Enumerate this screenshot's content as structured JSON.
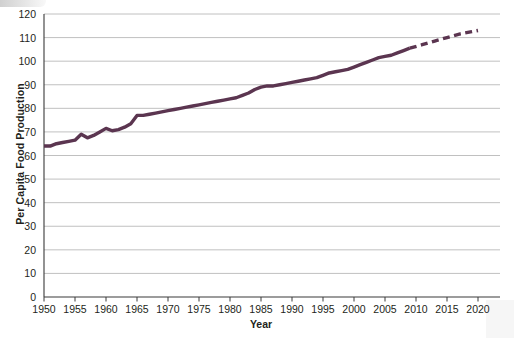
{
  "chart_data": {
    "type": "line",
    "title": "",
    "xlabel": "Year",
    "ylabel": "Per Capita Food Production",
    "xlim": [
      1950,
      2020
    ],
    "ylim": [
      0,
      120
    ],
    "xticks": [
      1950,
      1955,
      1960,
      1965,
      1970,
      1975,
      1980,
      1985,
      1990,
      1995,
      2000,
      2005,
      2010,
      2015,
      2020
    ],
    "yticks": [
      0,
      10,
      20,
      30,
      40,
      50,
      60,
      70,
      80,
      90,
      100,
      110,
      120
    ],
    "grid": "horizontal",
    "legend": "none",
    "line_color": "#5b3550",
    "series": [
      {
        "name": "Per Capita Food Production (observed)",
        "style": "solid",
        "x": [
          1950,
          1951,
          1952,
          1953,
          1954,
          1955,
          1956,
          1957,
          1958,
          1959,
          1960,
          1961,
          1962,
          1963,
          1964,
          1965,
          1966,
          1967,
          1968,
          1969,
          1970,
          1971,
          1972,
          1973,
          1974,
          1975,
          1976,
          1977,
          1978,
          1979,
          1980,
          1981,
          1982,
          1983,
          1984,
          1985,
          1986,
          1987,
          1988,
          1989,
          1990,
          1991,
          1992,
          1993,
          1994,
          1995,
          1996,
          1997,
          1998,
          1999,
          2000,
          2001,
          2002,
          2003,
          2004,
          2005,
          2006,
          2007,
          2008,
          2009
        ],
        "y": [
          64,
          64,
          65,
          65.5,
          66,
          66.5,
          69,
          67.5,
          68.5,
          70,
          71.5,
          70.5,
          71,
          72,
          73.5,
          77,
          77,
          77.5,
          78,
          78.5,
          79,
          79.5,
          80,
          80.5,
          81,
          81.5,
          82,
          82.5,
          83,
          83.5,
          84,
          84.5,
          85.5,
          86.5,
          88,
          89,
          89.5,
          89.5,
          90,
          90.5,
          91,
          91.5,
          92,
          92.5,
          93,
          94,
          95,
          95.5,
          96,
          96.5,
          97.5,
          98.5,
          99.5,
          100.5,
          101.5,
          102,
          102.5,
          103.5,
          104.5,
          105.5
        ]
      },
      {
        "name": "Per Capita Food Production (projected)",
        "style": "dashed",
        "x": [
          2009,
          2011,
          2013,
          2015,
          2017,
          2019,
          2020
        ],
        "y": [
          105.5,
          107,
          108.5,
          110,
          111.5,
          112.5,
          113
        ]
      }
    ]
  },
  "axis": {
    "y_title": "Per Capita Food Production",
    "x_title": "Year",
    "y_labels": [
      "120",
      "110",
      "100",
      "90",
      "80",
      "70",
      "60",
      "50",
      "40",
      "30",
      "20",
      "10",
      "0"
    ],
    "x_labels": [
      "1950",
      "1955",
      "1960",
      "1965",
      "1970",
      "1975",
      "1980",
      "1985",
      "1990",
      "1995",
      "2000",
      "2005",
      "2010",
      "2015",
      "2020"
    ]
  }
}
